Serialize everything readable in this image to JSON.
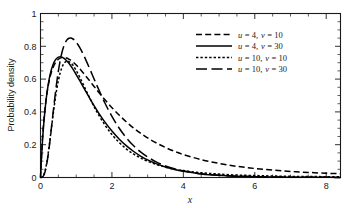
{
  "chart_data": {
    "type": "line",
    "title": "",
    "subtitle": "",
    "xlabel": "x",
    "ylabel": "Probability density",
    "xlim": [
      0,
      8.4
    ],
    "ylim": [
      0,
      1
    ],
    "xticks": [
      0,
      2,
      4,
      6,
      8
    ],
    "xtick_labels": [
      "0",
      "2",
      "4",
      "6",
      "8"
    ],
    "yticks": [
      0,
      0.2,
      0.4,
      0.6,
      0.8,
      1
    ],
    "ytick_labels": [
      "0",
      "0.2",
      "0.4",
      "0.6",
      "0.8",
      "1"
    ],
    "x_minor_step": 0.5,
    "y_minor_step": 0.05,
    "grid": false,
    "legend_position": "upper right",
    "series": [
      {
        "name": "u = 4, v = 10",
        "u": 4,
        "v": 10,
        "line_style": "dashed",
        "dash_pattern": "6,3.2",
        "color": "#000000",
        "peak_x": 0.62,
        "peak_y": 0.75,
        "x": [
          0.0,
          0.05,
          0.1,
          0.15,
          0.2,
          0.25,
          0.3,
          0.35,
          0.4,
          0.45,
          0.5,
          0.55,
          0.6,
          0.65,
          0.7,
          0.75,
          0.8,
          0.9,
          1.0,
          1.1,
          1.2,
          1.3,
          1.4,
          1.5,
          1.6,
          1.8,
          2.0,
          2.2,
          2.4,
          2.6,
          2.8,
          3.0,
          3.25,
          3.5,
          3.75,
          4.0,
          4.5,
          5.0,
          5.5,
          6.0,
          6.5,
          7.0,
          7.5,
          8.0,
          8.4
        ],
        "y": [
          0.0,
          0.222,
          0.364,
          0.466,
          0.541,
          0.597,
          0.639,
          0.67,
          0.693,
          0.71,
          0.721,
          0.728,
          0.731,
          0.732,
          0.73,
          0.727,
          0.721,
          0.706,
          0.686,
          0.663,
          0.637,
          0.61,
          0.583,
          0.555,
          0.528,
          0.475,
          0.426,
          0.381,
          0.34,
          0.303,
          0.27,
          0.241,
          0.21,
          0.183,
          0.16,
          0.14,
          0.109,
          0.086,
          0.068,
          0.055,
          0.045,
          0.037,
          0.031,
          0.026,
          0.023
        ]
      },
      {
        "name": "u = 4, v = 30",
        "u": 4,
        "v": 30,
        "line_style": "solid",
        "dash_pattern": "",
        "color": "#000000",
        "peak_x": 0.52,
        "peak_y": 0.705,
        "x": [
          0.0,
          0.05,
          0.1,
          0.15,
          0.2,
          0.25,
          0.3,
          0.35,
          0.4,
          0.45,
          0.5,
          0.55,
          0.6,
          0.65,
          0.7,
          0.75,
          0.8,
          0.9,
          1.0,
          1.1,
          1.2,
          1.3,
          1.4,
          1.5,
          1.6,
          1.8,
          2.0,
          2.2,
          2.4,
          2.6,
          2.8,
          3.0,
          3.25,
          3.5,
          3.75,
          4.0,
          4.5,
          5.0,
          5.5,
          6.0,
          6.5,
          7.0,
          7.5,
          8.0,
          8.4
        ],
        "y": [
          0.0,
          0.205,
          0.35,
          0.46,
          0.543,
          0.607,
          0.654,
          0.688,
          0.711,
          0.726,
          0.734,
          0.736,
          0.734,
          0.728,
          0.719,
          0.708,
          0.695,
          0.664,
          0.628,
          0.59,
          0.551,
          0.513,
          0.475,
          0.438,
          0.403,
          0.339,
          0.283,
          0.235,
          0.194,
          0.16,
          0.131,
          0.107,
          0.083,
          0.064,
          0.049,
          0.038,
          0.022,
          0.013,
          0.008,
          0.005,
          0.003,
          0.002,
          0.001,
          0.001,
          0.0
        ]
      },
      {
        "name": "u = 10, v = 10",
        "u": 10,
        "v": 10,
        "line_style": "dotted",
        "dash_pattern": "2.4,2.0",
        "color": "#000000",
        "peak_x": 0.67,
        "peak_y": 0.72,
        "x": [
          0.0,
          0.05,
          0.1,
          0.15,
          0.2,
          0.25,
          0.3,
          0.35,
          0.4,
          0.45,
          0.5,
          0.55,
          0.6,
          0.65,
          0.7,
          0.75,
          0.8,
          0.9,
          1.0,
          1.1,
          1.2,
          1.3,
          1.4,
          1.5,
          1.6,
          1.8,
          2.0,
          2.2,
          2.4,
          2.6,
          2.8,
          3.0,
          3.25,
          3.5,
          3.75,
          4.0,
          4.5,
          5.0,
          5.5,
          6.0,
          6.5,
          7.0,
          7.5,
          8.0,
          8.4
        ],
        "y": [
          0.0,
          0.003,
          0.021,
          0.062,
          0.125,
          0.204,
          0.291,
          0.379,
          0.46,
          0.532,
          0.591,
          0.637,
          0.671,
          0.693,
          0.705,
          0.709,
          0.706,
          0.687,
          0.653,
          0.611,
          0.566,
          0.52,
          0.475,
          0.432,
          0.392,
          0.321,
          0.262,
          0.214,
          0.175,
          0.144,
          0.119,
          0.099,
          0.079,
          0.063,
          0.051,
          0.042,
          0.029,
          0.021,
          0.015,
          0.012,
          0.009,
          0.007,
          0.006,
          0.005,
          0.004
        ]
      },
      {
        "name": "u = 10, v = 30",
        "u": 10,
        "v": 30,
        "line_style": "long-dashed",
        "dash_pattern": "11,4.5",
        "color": "#000000",
        "peak_x": 0.82,
        "peak_y": 0.865,
        "x": [
          0.0,
          0.05,
          0.1,
          0.15,
          0.2,
          0.25,
          0.3,
          0.35,
          0.4,
          0.45,
          0.5,
          0.55,
          0.6,
          0.65,
          0.7,
          0.75,
          0.8,
          0.85,
          0.9,
          0.95,
          1.0,
          1.1,
          1.2,
          1.3,
          1.4,
          1.5,
          1.6,
          1.8,
          2.0,
          2.2,
          2.4,
          2.6,
          2.8,
          3.0,
          3.25,
          3.5,
          3.75,
          4.0,
          4.5,
          5.0,
          5.5,
          6.0,
          6.5,
          7.0,
          7.5,
          8.0,
          8.4
        ],
        "y": [
          0.0,
          0.002,
          0.017,
          0.054,
          0.115,
          0.196,
          0.29,
          0.389,
          0.484,
          0.572,
          0.649,
          0.712,
          0.762,
          0.799,
          0.825,
          0.841,
          0.849,
          0.85,
          0.846,
          0.838,
          0.826,
          0.792,
          0.75,
          0.702,
          0.652,
          0.601,
          0.551,
          0.456,
          0.373,
          0.302,
          0.243,
          0.195,
          0.156,
          0.125,
          0.094,
          0.071,
          0.053,
          0.04,
          0.023,
          0.013,
          0.008,
          0.005,
          0.003,
          0.002,
          0.001,
          0.001,
          0.0
        ]
      }
    ]
  },
  "axes": {
    "x_title": "x",
    "y_title": "Probability density"
  },
  "legend": {
    "entries": [
      {
        "label": "u = 4, v = 10",
        "var1": "u",
        "val1": "= 4,",
        "var2": "v",
        "val2": "= 10"
      },
      {
        "label": "u = 4, v = 30",
        "var1": "u",
        "val1": "= 4,",
        "var2": "v",
        "val2": "= 30"
      },
      {
        "label": "u = 10, v = 10",
        "var1": "u",
        "val1": "= 10,",
        "var2": "v",
        "val2": "= 10"
      },
      {
        "label": "u = 10, v = 30",
        "var1": "u",
        "val1": "= 10,",
        "var2": "v",
        "val2": "= 30"
      }
    ]
  },
  "colors": {
    "line": "#000000",
    "axis": "#1a1a1a",
    "background": "#ffffff"
  }
}
